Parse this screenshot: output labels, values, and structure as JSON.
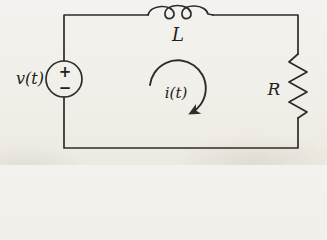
{
  "diagram": {
    "kind": "series-rl-circuit",
    "background_color": "#f1efe9",
    "stroke_color": "#2e2c2a",
    "source": {
      "label": "v(t)",
      "polarity_plus": "+",
      "polarity_minus": "−"
    },
    "inductor": {
      "label": "L"
    },
    "resistor": {
      "label": "R"
    },
    "mesh_current": {
      "label": "i(t)"
    }
  }
}
